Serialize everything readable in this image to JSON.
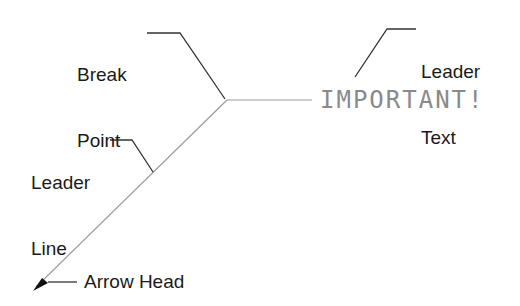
{
  "labels": {
    "break_point": [
      "Break",
      "Point"
    ],
    "leader_text": [
      "Leader",
      "Text"
    ],
    "leader_line": [
      "Leader",
      "Line"
    ],
    "arrow_head": "Arrow Head"
  },
  "annotation_text": "IMPORTANT!",
  "colors": {
    "label": "#1a1a1a",
    "callout_line": "#333333",
    "leader_line": "#9a9a9a",
    "annotation_text": "#8a8a8a"
  }
}
